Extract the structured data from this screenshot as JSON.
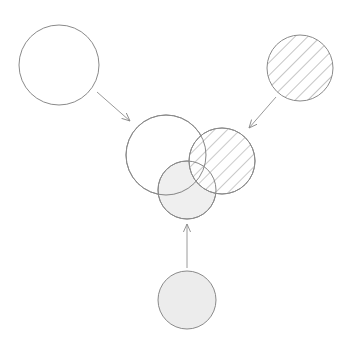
{
  "diagram": {
    "type": "venn-composition",
    "colors": {
      "background": "#ffffff",
      "stroke": "#8a8a8a",
      "hatch": "#8c8c8c",
      "gray_fill": "#ececec",
      "arrow": "#9a9a9a"
    },
    "sources": [
      {
        "id": "plain-set",
        "fill": "none",
        "cx": 59,
        "cy": 65,
        "r": 40
      },
      {
        "id": "hatched-set",
        "fill": "hatch",
        "cx": 300,
        "cy": 68,
        "r": 33
      },
      {
        "id": "gray-set",
        "fill": "gray",
        "cx": 187,
        "cy": 300,
        "r": 29
      }
    ],
    "center": [
      {
        "id": "plain-set",
        "fill": "none",
        "cx": 166,
        "cy": 155,
        "r": 40
      },
      {
        "id": "hatched-set",
        "fill": "hatch",
        "cx": 222,
        "cy": 161,
        "r": 33
      },
      {
        "id": "gray-set",
        "fill": "gray",
        "cx": 187,
        "cy": 190,
        "r": 29
      }
    ],
    "arrows": [
      {
        "from": "plain-set",
        "x1": 97,
        "y1": 92,
        "x2": 130,
        "y2": 121
      },
      {
        "from": "hatched-set",
        "x1": 276,
        "y1": 97,
        "x2": 249,
        "y2": 128
      },
      {
        "from": "gray-set",
        "x1": 187,
        "y1": 268,
        "x2": 187,
        "y2": 224
      }
    ]
  }
}
